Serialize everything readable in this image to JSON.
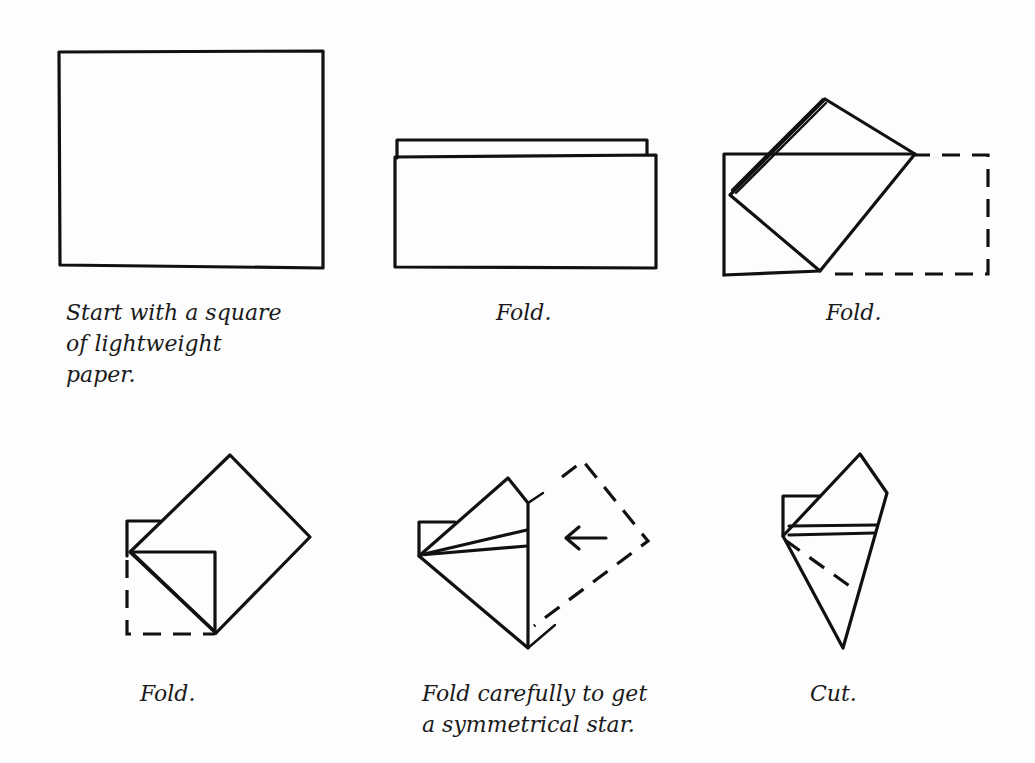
{
  "diagram": {
    "steps": [
      {
        "id": 1,
        "caption": "Start with a square\nof lightweight\npaper.",
        "figure": "square-paper"
      },
      {
        "id": 2,
        "caption": "Fold.",
        "figure": "folded-in-half"
      },
      {
        "id": 3,
        "caption": "Fold.",
        "figure": "corner-folded-diagonal"
      },
      {
        "id": 4,
        "caption": "Fold.",
        "figure": "folded-diamond"
      },
      {
        "id": 5,
        "caption": "Fold carefully to get\na symmetrical star.",
        "figure": "fold-back-arrow",
        "arrow": "←"
      },
      {
        "id": 6,
        "caption": "Cut.",
        "figure": "cut-line-dashed"
      }
    ]
  }
}
